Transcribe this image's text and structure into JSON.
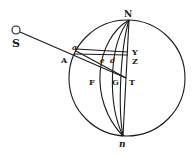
{
  "diagram": {
    "type": "geometric-figure",
    "colors": {
      "ink": "#1a1a1a",
      "background": "#ffffff"
    },
    "labels": {
      "S": "S",
      "N": "N",
      "n": "n",
      "a": "a",
      "A": "A",
      "Y": "Y",
      "Z": "Z",
      "e": "e",
      "d": "d",
      "F": "F",
      "G": "G",
      "T": "T"
    }
  }
}
